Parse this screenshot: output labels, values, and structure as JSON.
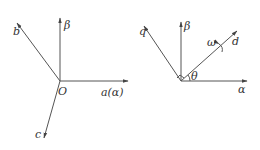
{
  "diagrams": [
    {
      "name": "abc-frame",
      "origin_label": "O",
      "axes": [
        {
          "id": "beta",
          "label": "β"
        },
        {
          "id": "b",
          "label": "b"
        },
        {
          "id": "a",
          "label": "a(α)"
        },
        {
          "id": "c",
          "label": "c"
        }
      ]
    },
    {
      "name": "dq-frame",
      "axes": [
        {
          "id": "q",
          "label": "q"
        },
        {
          "id": "beta",
          "label": "β"
        },
        {
          "id": "d",
          "label": "d"
        },
        {
          "id": "alpha",
          "label": "α"
        }
      ],
      "angle_label": "θ",
      "rotation_label": "ω"
    }
  ],
  "colors": {
    "line": "#555555",
    "text": "#333333",
    "background": "#ffffff"
  }
}
